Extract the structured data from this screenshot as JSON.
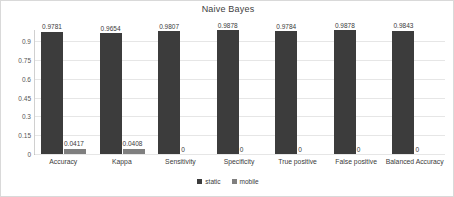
{
  "chart_data": {
    "type": "bar",
    "title": "Naive Bayes",
    "xlabel": "",
    "ylabel": "",
    "ylim": [
      0,
      0.99
    ],
    "yticks": [
      "0",
      "0.15",
      "0.3",
      "0.45",
      "0.6",
      "0.75",
      "0.9"
    ],
    "ytick_values": [
      0,
      0.15,
      0.3,
      0.45,
      0.6,
      0.75,
      0.9
    ],
    "grid": true,
    "legend_position": "bottom",
    "categories": [
      "Accuracy",
      "Kappa",
      "Sensitivity",
      "Specificity",
      "True positive",
      "False positive",
      "Balanced Accuracy"
    ],
    "series": [
      {
        "name": "static",
        "color": "#3c3c3c",
        "values": [
          0.9781,
          0.9654,
          0.9807,
          0.9878,
          0.9784,
          0.9878,
          0.9843
        ],
        "labels": [
          "0.9781",
          "0.9654",
          "0.9807",
          "0.9878",
          "0.9784",
          "0.9878",
          "0.9843"
        ]
      },
      {
        "name": "mobile",
        "color": "#7f7f7f",
        "values": [
          0.0417,
          0.0408,
          0,
          0,
          0,
          0,
          0
        ],
        "labels": [
          "0.0417",
          "0.0408",
          "0",
          "0",
          "0",
          "0",
          "0"
        ]
      }
    ]
  }
}
